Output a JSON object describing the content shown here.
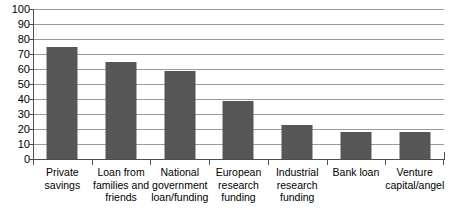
{
  "chart_data": {
    "type": "bar",
    "title": "",
    "xlabel": "",
    "ylabel": "",
    "categories": [
      "Private\nsavings",
      "Loan from\nfamilies and\nfriends",
      "National\ngovernment\nloan/funding",
      "European\nresearch\nfunding",
      "Industrial\nresearch\nfunding",
      "Bank loan",
      "Venture\ncapital/angel"
    ],
    "values": [
      75,
      65,
      59,
      39,
      23,
      18,
      18
    ],
    "ylim": [
      0,
      100
    ],
    "ytick_labels": [
      "100",
      "90",
      "80",
      "70",
      "60",
      "50",
      "40",
      "30",
      "20",
      "10",
      "0"
    ],
    "ytick_values": [
      100,
      90,
      80,
      70,
      60,
      50,
      40,
      30,
      20,
      10,
      0
    ],
    "grid": true,
    "legend": false,
    "series_color": "#565656",
    "gridline_color": "#9a9a9a",
    "axis_color": "#4d4d4d"
  }
}
